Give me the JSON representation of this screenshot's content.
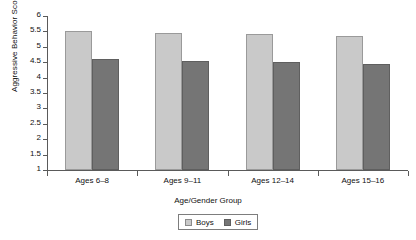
{
  "chart_data": {
    "type": "bar",
    "title": "",
    "xlabel": "Age/Gender Group",
    "ylabel": "Aggressive Behavior Score",
    "categories": [
      "Ages 6–8",
      "Ages 9–11",
      "Ages 12–14",
      "Ages 15–16"
    ],
    "series": [
      {
        "name": "Boys",
        "color": "#c9c9c9",
        "values": [
          5.5,
          5.45,
          5.4,
          5.35
        ]
      },
      {
        "name": "Girls",
        "color": "#757575",
        "values": [
          4.6,
          4.55,
          4.5,
          4.45
        ]
      }
    ],
    "ylim": [
      1,
      6
    ],
    "ytick_labels": [
      "6",
      "5.5",
      "5",
      "4.5",
      "4",
      "3.5",
      "3",
      "2.5",
      "2",
      "1.5",
      "1"
    ],
    "ytick_values": [
      6,
      5.5,
      5,
      4.5,
      4,
      3.5,
      3,
      2.5,
      2,
      1.5,
      1
    ],
    "grid": false,
    "legend_position": "bottom-center",
    "legend_entries": [
      "Boys",
      "Girls"
    ]
  }
}
